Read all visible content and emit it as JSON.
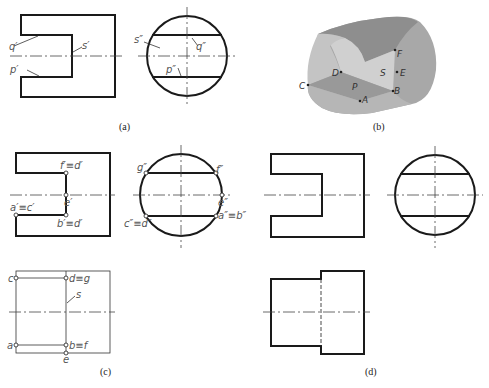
{
  "figure": {
    "captions": {
      "a": "(a)",
      "b": "(b)",
      "c": "(c)",
      "d": "(d)"
    },
    "panel_a": {
      "labels": {
        "q_front": "q′",
        "p_front": "p′",
        "s_front": "s′",
        "s_side": "s″",
        "q_side": "q″",
        "p_side": "p″"
      }
    },
    "panel_b": {
      "points": {
        "A": "A",
        "B": "B",
        "C": "C",
        "D": "D",
        "E": "E",
        "F": "F"
      },
      "surfaces": {
        "P": "P",
        "S": "S"
      },
      "colors": {
        "outer": "#a9a9a9",
        "top": "#8f8f8f",
        "inner": "#d2d2d2",
        "plane_p": "#9a9a9a",
        "plane_s": "#cfcfcf"
      }
    },
    "panel_c": {
      "front_labels": {
        "f_d": "f′≡d′",
        "e": "e′",
        "a_c": "a′≡c′",
        "b_d": "b′≡d′"
      },
      "side_labels": {
        "g": "g″",
        "f": "f″",
        "e": "e″",
        "c_d": "c″≡d″",
        "a_b": "a″≡b″"
      },
      "top_labels": {
        "c": "c",
        "d_g": "d≡g",
        "s": "s",
        "a": "a",
        "b_f": "b≡f",
        "e": "e"
      }
    },
    "panel_d": {}
  }
}
